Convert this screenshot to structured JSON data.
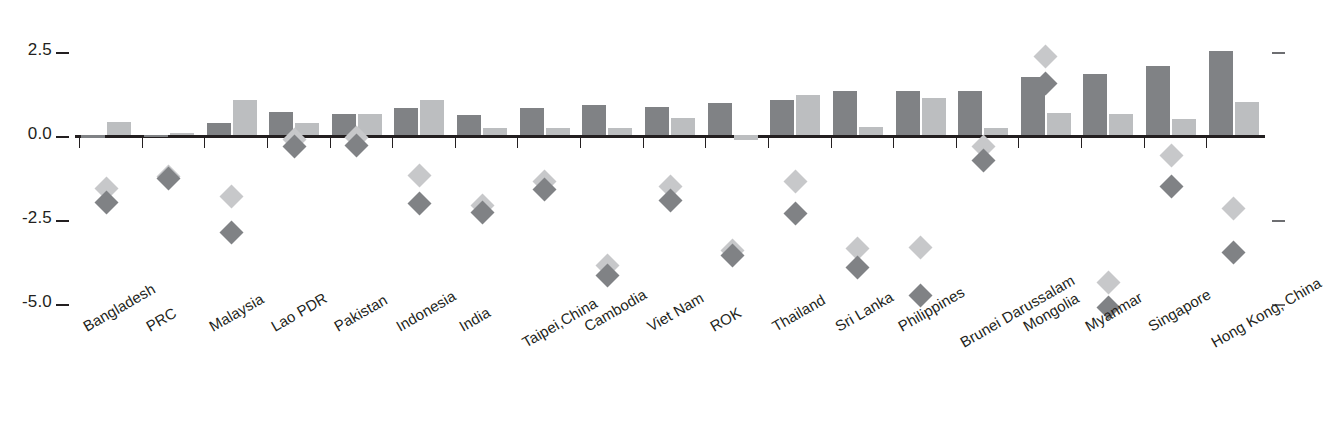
{
  "chart_data": {
    "type": "bar",
    "title": "",
    "subtitle": "",
    "xlabel": "",
    "ylabel": "",
    "ylim": [
      -6.0,
      3.0
    ],
    "grid": false,
    "legend_position": "none",
    "y_ticks": [
      "2.5",
      "0.0",
      "-2.5",
      "-5.0"
    ],
    "y_tick_values": [
      2.5,
      0.0,
      -2.5,
      -5.0
    ],
    "categories": [
      "Bangladesh",
      "PRC",
      "Malaysia",
      "Lao PDR",
      "Pakistan",
      "Indonesia",
      "India",
      "Taipei,China",
      "Cambodia",
      "Viet Nam",
      "ROK",
      "Thailand",
      "Sri Lanka",
      "Philippines",
      "Brunei Darussalam",
      "Mongolia",
      "Myanmar",
      "Singapore",
      "Hong Kong, China"
    ],
    "series": [
      {
        "name": "bar-dark",
        "type": "bar",
        "color": "#808285",
        "values": [
          -0.08,
          -0.07,
          0.35,
          0.7,
          0.62,
          0.8,
          0.6,
          0.8,
          0.9,
          0.85,
          0.95,
          1.05,
          1.3,
          1.32,
          1.32,
          1.72,
          1.82,
          2.05,
          2.5
        ]
      },
      {
        "name": "bar-light",
        "type": "bar",
        "color": "#bcbec0",
        "values": [
          0.4,
          0.06,
          1.05,
          0.35,
          0.62,
          1.05,
          0.2,
          0.22,
          0.2,
          0.5,
          -0.15,
          1.2,
          0.25,
          1.1,
          0.2,
          0.65,
          0.62,
          0.48,
          1.0
        ]
      },
      {
        "name": "marker-light",
        "type": "scatter",
        "color": "#c7c8ca",
        "values": [
          -1.6,
          -1.25,
          -1.85,
          -0.12,
          -0.08,
          -1.2,
          -2.1,
          -1.4,
          -3.9,
          -1.55,
          -3.45,
          -1.4,
          -3.4,
          -3.35,
          -0.35,
          2.35,
          -4.4,
          -0.6,
          -2.2
        ]
      },
      {
        "name": "marker-dark",
        "type": "scatter",
        "color": "#808285",
        "values": [
          -2.0,
          -1.3,
          -2.9,
          -0.35,
          -0.3,
          -2.05,
          -2.3,
          -1.62,
          -4.2,
          -1.95,
          -3.6,
          -2.35,
          -3.95,
          -4.8,
          -0.75,
          1.55,
          -5.15,
          -1.55,
          -3.5
        ]
      }
    ]
  },
  "axis": {
    "right_ticks_present": true
  }
}
